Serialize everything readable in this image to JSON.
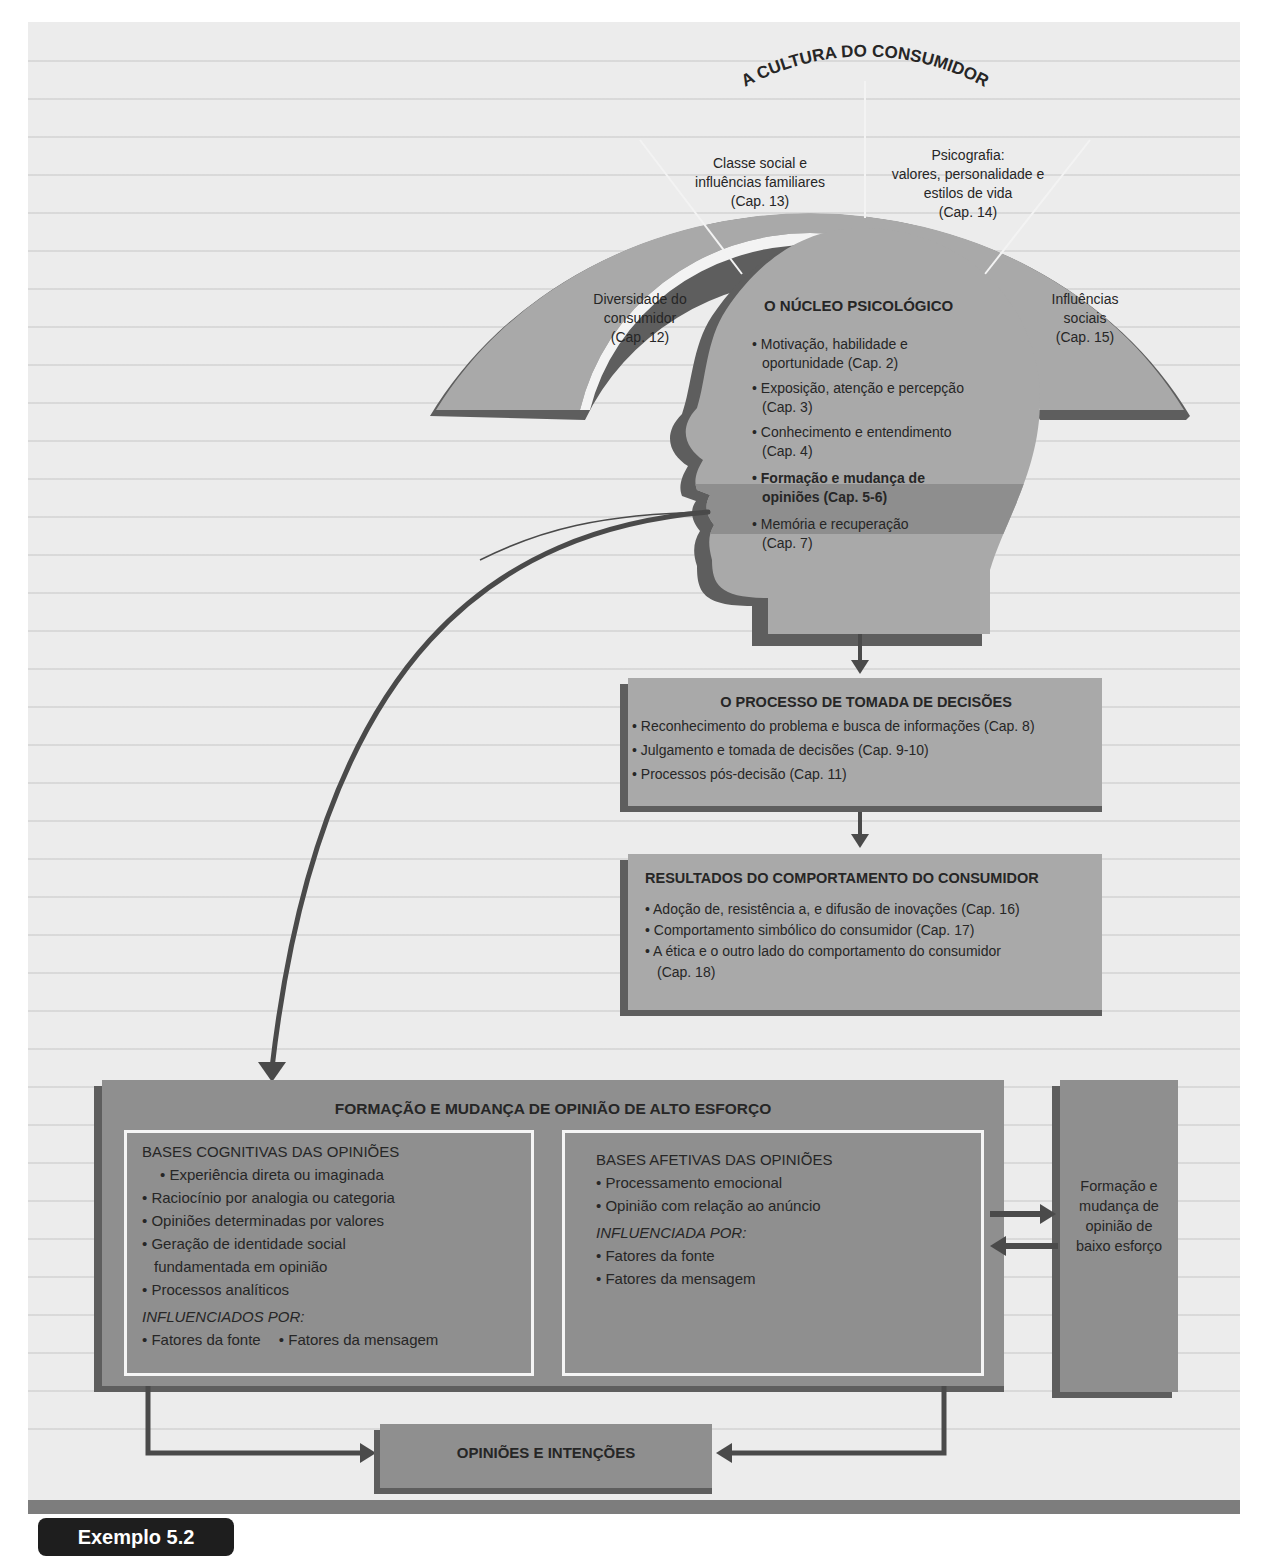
{
  "figure_label": "Exemplo 5.2",
  "colors": {
    "panel_bg": "#ececec",
    "box_fill": "#a9a9a9",
    "box_shadow": "#5e5e5e",
    "highlight_band": "#8e8e8e",
    "arrow": "#4a4a4a",
    "inner_border": "#f5f5f5",
    "tag_bg": "#1e1e1e"
  },
  "culture": {
    "title": "A CULTURA DO CONSUMIDOR",
    "segments": [
      {
        "lines": [
          "Diversidade do",
          "consumidor",
          "(Cap. 12)"
        ]
      },
      {
        "lines": [
          "Classe social e",
          "influências familiares",
          "(Cap. 13)"
        ]
      },
      {
        "lines": [
          "Psicografia:",
          "valores, personalidade e",
          "estilos de vida",
          "(Cap. 14)"
        ]
      },
      {
        "lines": [
          "Influências",
          "sociais",
          "(Cap. 15)"
        ]
      }
    ]
  },
  "psych_core": {
    "title": "O NÚCLEO PSICOLÓGICO",
    "items": [
      {
        "lines": [
          "Motivação, habilidade e",
          "oportunidade (Cap. 2)"
        ],
        "highlight": false
      },
      {
        "lines": [
          "Exposição, atenção e percepção",
          "(Cap. 3)"
        ],
        "highlight": false
      },
      {
        "lines": [
          "Conhecimento e entendimento",
          "(Cap. 4)"
        ],
        "highlight": false
      },
      {
        "lines": [
          "Formação e mudança de",
          "opiniões (Cap. 5-6)"
        ],
        "highlight": true
      },
      {
        "lines": [
          "Memória e recuperação",
          "(Cap. 7)"
        ],
        "highlight": false
      }
    ]
  },
  "decision_process": {
    "title": "O PROCESSO DE TOMADA DE DECISÕES",
    "items": [
      "Reconhecimento do problema e busca de informações (Cap. 8)",
      "Julgamento e tomada de decisões (Cap. 9-10)",
      "Processos pós-decisão (Cap. 11)"
    ]
  },
  "outcomes": {
    "title": "RESULTADOS DO COMPORTAMENTO DO CONSUMIDOR",
    "items": [
      "Adoção de, resistência a, e difusão de inovações (Cap. 16)",
      "Comportamento simbólico do consumidor (Cap. 17)",
      "A ética e o outro lado do comportamento do consumidor",
      "(Cap. 18)"
    ]
  },
  "high_effort": {
    "title": "FORMAÇÃO E MUDANÇA DE OPINIÃO DE ALTO ESFORÇO",
    "cognitive": {
      "heading": "BASES COGNITIVAS DAS OPINIÕES",
      "items": [
        "Experiência direta ou imaginada",
        "Raciocínio por analogia ou categoria",
        "Opiniões determinadas por valores",
        "Geração de identidade social",
        "fundamentada em opinião",
        "Processos analíticos"
      ],
      "influenced_label": "INFLUENCIADOS POR:",
      "influences": [
        "Fatores da fonte",
        "Fatores da mensagem"
      ]
    },
    "affective": {
      "heading": "BASES AFETIVAS DAS OPINIÕES",
      "items": [
        "Processamento emocional",
        "Opinião com relação ao anúncio"
      ],
      "influenced_label": "INFLUENCIADA POR:",
      "influences": [
        "Fatores da fonte",
        "Fatores da mensagem"
      ]
    }
  },
  "low_effort": {
    "lines": [
      "Formação e",
      "mudança de",
      "opinião de",
      "baixo esforço"
    ]
  },
  "attitudes_intentions": {
    "title": "OPINIÕES E INTENÇÕES"
  }
}
